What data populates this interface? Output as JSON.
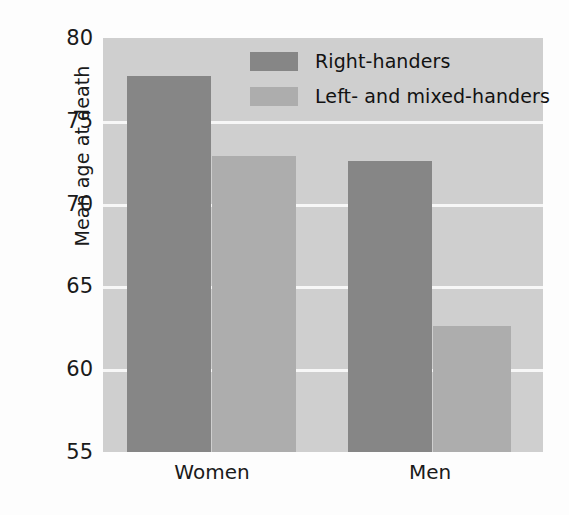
{
  "chart_data": {
    "type": "bar",
    "title": "",
    "xlabel": "",
    "ylabel": "Mean age at death",
    "categories": [
      "Women",
      "Men"
    ],
    "series": [
      {
        "name": "Right-handers",
        "values": [
          77.7,
          72.6
        ],
        "color": "#868686"
      },
      {
        "name": "Left- and mixed-handers",
        "values": [
          72.9,
          62.6
        ],
        "color": "#adadad"
      }
    ],
    "ylim": [
      55,
      80
    ],
    "yticks": [
      80,
      75,
      70,
      65,
      60,
      55
    ],
    "ytick_labels": [
      "80",
      "75",
      "70",
      "65",
      "60",
      "55"
    ],
    "gridlines": [
      75,
      70,
      65,
      60
    ],
    "grid": true,
    "grid_color": "#f7f7f7",
    "legend_position": "upper center",
    "plot_background": "#cfcfcf",
    "figure_background": "#fdfdfd"
  },
  "legend": {
    "entries": [
      {
        "label": "Right-handers",
        "swatch": "dark"
      },
      {
        "label": "Left- and mixed-handers",
        "swatch": "light"
      }
    ]
  },
  "axis": {
    "y_title": "Mean age at death",
    "y_labels": [
      "80",
      "75",
      "70",
      "65",
      "60",
      "55"
    ],
    "x_labels": [
      "Women",
      "Men"
    ]
  }
}
